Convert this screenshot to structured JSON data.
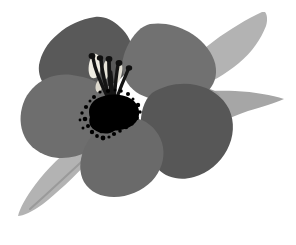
{
  "artwork": {
    "title": "Grayscale stylized flower illustration",
    "subject": "flower-with-leaves",
    "style": "flat-grayscale-vector",
    "canvas": {
      "width": 296,
      "height": 245,
      "background_color": "#ffffff"
    },
    "palette": {
      "background": "#ffffff",
      "leaf_light": "#b3b3b3",
      "leaf_mid": "#a6a6a6",
      "leaf_shadow": "#9c9c9c",
      "leaf_vein": "#9a9a9a",
      "petal_top_left": "#595959",
      "petal_top_right": "#717171",
      "petal_left": "#6e6e6e",
      "petal_bottom": "#6a6a6a",
      "petal_right": "#575757",
      "stamen_dark": "#1a1a1a",
      "center_speckle": "#000000",
      "highlight_cream": "#efece2"
    },
    "elements": {
      "leaves": [
        {
          "name": "upper-right-leaf",
          "color": "#b3b3b3"
        },
        {
          "name": "right-leaf",
          "color": "#a6a6a6"
        },
        {
          "name": "lower-left-leaf",
          "color": "#b0b0b0"
        }
      ],
      "petals": [
        {
          "name": "petal-top-left",
          "color": "#595959"
        },
        {
          "name": "petal-top-right",
          "color": "#717171"
        },
        {
          "name": "petal-left",
          "color": "#6e6e6e"
        },
        {
          "name": "petal-right",
          "color": "#575757"
        },
        {
          "name": "petal-bottom",
          "color": "#6a6a6a"
        }
      ],
      "center": {
        "name": "flower-center",
        "stamen_count": 6,
        "stamen_color": "#141414",
        "anther_color": "#101010",
        "speckle_color": "#000000",
        "highlight_color": "#efece2"
      }
    }
  }
}
